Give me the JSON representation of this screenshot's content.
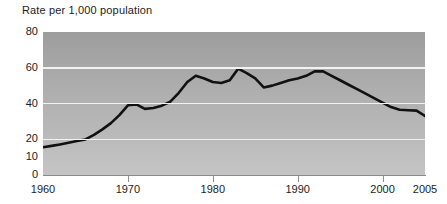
{
  "chart_data": {
    "type": "line",
    "title": "Rate per 1,000 population",
    "xlabel": "",
    "ylabel": "",
    "xlim": [
      1960,
      2005
    ],
    "ylim": [
      0,
      80
    ],
    "grid": true,
    "legend": null,
    "y_ticks": [
      {
        "value": 80,
        "label": "80"
      },
      {
        "value": 60,
        "label": "60"
      },
      {
        "value": 40,
        "label": "40"
      },
      {
        "value": 20,
        "label": "20"
      },
      {
        "value": 10,
        "label": "10"
      },
      {
        "value": 0,
        "label": "0"
      }
    ],
    "gridlines": [
      20,
      40,
      60,
      80
    ],
    "x_ticks": [
      {
        "value": 1960,
        "label": "1960"
      },
      {
        "value": 1970,
        "label": "1970"
      },
      {
        "value": 1980,
        "label": "1980"
      },
      {
        "value": 1990,
        "label": "1990"
      },
      {
        "value": 2000,
        "label": "2000"
      },
      {
        "value": 2005,
        "label": "2005"
      }
    ],
    "series": [
      {
        "name": "Rate per 1,000 population",
        "color": "#111111",
        "x": [
          1960,
          1961,
          1962,
          1963,
          1964,
          1965,
          1966,
          1967,
          1968,
          1969,
          1970,
          1971,
          1972,
          1973,
          1974,
          1975,
          1976,
          1977,
          1978,
          1979,
          1980,
          1981,
          1982,
          1983,
          1984,
          1985,
          1986,
          1987,
          1988,
          1989,
          1990,
          1991,
          1992,
          1993,
          1994,
          1995,
          1996,
          1997,
          1998,
          1999,
          2000,
          2001,
          2002,
          2003,
          2004,
          2005
        ],
        "values": [
          15.5,
          16.3,
          17.1,
          18.0,
          19.0,
          19.9,
          22.5,
          25.5,
          29.0,
          33.5,
          39.0,
          39.5,
          37.0,
          37.5,
          38.8,
          41.0,
          46.0,
          52.0,
          55.5,
          54.0,
          52.0,
          51.5,
          53.0,
          59.5,
          57.0,
          54.0,
          49.0,
          50.0,
          51.5,
          53.0,
          54.0,
          55.5,
          58.0,
          58.0,
          55.5,
          53.0,
          50.5,
          48.0,
          45.5,
          43.0,
          40.5,
          38.0,
          36.5,
          36.2,
          36.0,
          33.0
        ]
      }
    ]
  }
}
